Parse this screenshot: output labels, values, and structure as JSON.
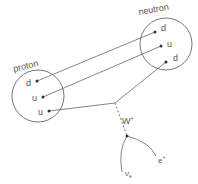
{
  "diagram": {
    "proton": {
      "label": "proton",
      "quarks": [
        "d",
        "u",
        "u"
      ]
    },
    "neutron": {
      "label": "neutron",
      "quarks": [
        "d",
        "u",
        "d"
      ]
    },
    "boson": {
      "label": "W",
      "charge": "+"
    },
    "products": {
      "neutrino": {
        "symbol": "ν",
        "sub": "e"
      },
      "positron": {
        "symbol": "e",
        "sup": "+"
      }
    },
    "colors": {
      "line": "#666666",
      "text": "#555555",
      "dot": "#333333"
    }
  }
}
